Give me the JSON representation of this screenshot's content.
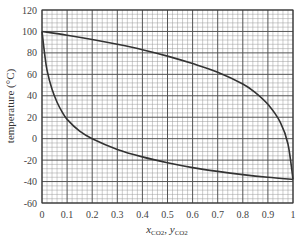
{
  "chart_data": {
    "type": "line",
    "title": "",
    "xlabel": "x CO2, y CO2",
    "xlabel_parts": {
      "x": "x",
      "x_sub": "CO2",
      "sep": ", ",
      "y": "y",
      "y_sub": "CO2"
    },
    "ylabel": "temperature (°C)",
    "xlim": [
      0,
      1
    ],
    "ylim": [
      -60,
      120
    ],
    "xticks": [
      "0",
      "0.1",
      "0.2",
      "0.3",
      "0.4",
      "0.5",
      "0.6",
      "0.7",
      "0.8",
      "0.9",
      "1"
    ],
    "yticks": [
      "120",
      "100",
      "80",
      "60",
      "40",
      "20",
      "0",
      "-20",
      "-40",
      "-60"
    ],
    "grid": {
      "major": true,
      "minor": true,
      "minor_per_major": 5
    },
    "legend": null,
    "series": [
      {
        "name": "dew-line (vapor, y CO2)",
        "x": [
          0,
          0.1,
          0.2,
          0.3,
          0.4,
          0.5,
          0.6,
          0.7,
          0.8,
          0.85,
          0.9,
          0.95,
          0.98,
          1.0
        ],
        "y": [
          100,
          96.5,
          92.5,
          88,
          83,
          77,
          70,
          62,
          51,
          43,
          32,
          15,
          -5,
          -38
        ]
      },
      {
        "name": "bubble-line (liquid, x CO2)",
        "x": [
          0,
          0.01,
          0.02,
          0.04,
          0.06,
          0.08,
          0.1,
          0.15,
          0.2,
          0.3,
          0.4,
          0.5,
          0.6,
          0.7,
          0.8,
          0.9,
          1.0
        ],
        "y": [
          100,
          80,
          64,
          46,
          34,
          25,
          18,
          7,
          0,
          -10,
          -17,
          -22.5,
          -27,
          -30.5,
          -33.5,
          -36,
          -38
        ]
      }
    ]
  },
  "colors": {
    "curve": "#333333",
    "major_grid": "#555555",
    "minor_grid": "#9a9a9a",
    "axis": "#333333"
  }
}
